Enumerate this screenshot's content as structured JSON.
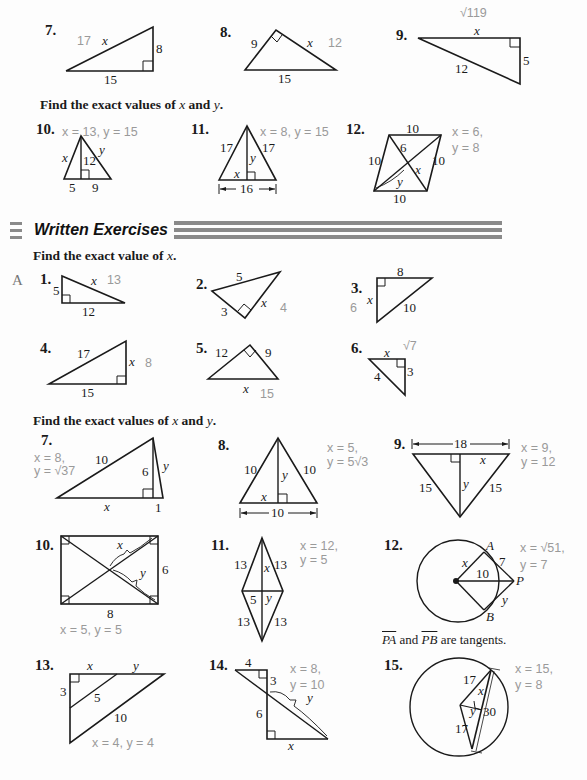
{
  "oral_exercises_continued": {
    "problems": [
      {
        "number": "7.",
        "answer": "17",
        "labels": [
          "x",
          "8",
          "15"
        ]
      },
      {
        "number": "8.",
        "answer": "12",
        "labels": [
          "9",
          "x",
          "15"
        ]
      },
      {
        "number": "9.",
        "answer": "√119",
        "labels": [
          "x",
          "12",
          "5"
        ]
      }
    ],
    "instruction_xy": "Find the exact values of x and y.",
    "xy_problems": [
      {
        "number": "10.",
        "answer": "x = 13, y = 15",
        "labels": [
          "x",
          "y",
          "12",
          "5",
          "9"
        ]
      },
      {
        "number": "11.",
        "answer": "x = 8, y = 15",
        "labels": [
          "17",
          "17",
          "y",
          "x",
          "16"
        ]
      },
      {
        "number": "12.",
        "answer_line1": "x = 6,",
        "answer_line2": "y = 8",
        "labels": [
          "10",
          "10",
          "10",
          "10",
          "6",
          "x",
          "y"
        ]
      }
    ]
  },
  "section": {
    "title": "Written Exercises"
  },
  "written": {
    "instruction_x": "Find the exact value of x.",
    "level": "A",
    "problems": [
      {
        "number": "1.",
        "answer": "13",
        "labels": [
          "5",
          "x",
          "12"
        ]
      },
      {
        "number": "2.",
        "answer": "4",
        "labels": [
          "5",
          "3",
          "x"
        ]
      },
      {
        "number": "3.",
        "answer": "6",
        "labels": [
          "8",
          "x",
          "10"
        ]
      },
      {
        "number": "4.",
        "answer": "8",
        "labels": [
          "17",
          "x",
          "15"
        ]
      },
      {
        "number": "5.",
        "answer": "15",
        "labels": [
          "12",
          "9",
          "x"
        ]
      },
      {
        "number": "6.",
        "answer": "√7",
        "labels": [
          "x",
          "4",
          "3"
        ]
      }
    ],
    "instruction_xy": "Find the exact values of x and y.",
    "xy_problems": [
      {
        "number": "7.",
        "answer_line1": "x = 8,",
        "answer_line2": "y = √37",
        "labels": [
          "10",
          "6",
          "y",
          "x",
          "1"
        ]
      },
      {
        "number": "8.",
        "answer_line1": "x = 5,",
        "answer_line2": "y = 5√3",
        "labels": [
          "10",
          "10",
          "y",
          "x",
          "10"
        ]
      },
      {
        "number": "9.",
        "answer_line1": "x = 9,",
        "answer_line2": "y = 12",
        "labels": [
          "18",
          "x",
          "15",
          "15",
          "y"
        ]
      },
      {
        "number": "10.",
        "answer": "x = 5, y = 5",
        "labels": [
          "x",
          "y",
          "6",
          "8"
        ]
      },
      {
        "number": "11.",
        "answer_line1": "x = 12,",
        "answer_line2": "y = 5",
        "labels": [
          "13",
          "13",
          "13",
          "13",
          "x",
          "5",
          "y"
        ]
      },
      {
        "number": "12.",
        "answer_line1": "x = √51,",
        "answer_line2": "y = 7",
        "labels": [
          "A",
          "x",
          "7",
          "10",
          "P",
          "y",
          "B"
        ],
        "caption_parts": [
          "PA",
          " and ",
          "PB",
          " are tangents."
        ]
      },
      {
        "number": "13.",
        "answer": "x = 4, y = 4",
        "labels": [
          "x",
          "y",
          "3",
          "5",
          "10"
        ]
      },
      {
        "number": "14.",
        "answer_line1": "x = 8,",
        "answer_line2": "y = 10",
        "labels": [
          "4",
          "3",
          "6",
          "y",
          "x"
        ]
      },
      {
        "number": "15.",
        "answer_line1": "x = 15,",
        "answer_line2": "y = 8",
        "labels": [
          "17",
          "x",
          "y",
          "30",
          "17"
        ]
      }
    ]
  }
}
